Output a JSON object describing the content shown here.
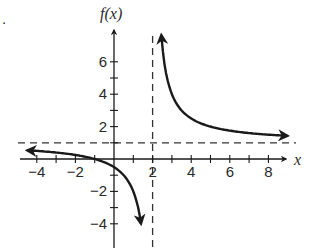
{
  "problem_marker": ".",
  "chart_data": {
    "type": "line",
    "title": "",
    "xlabel": "x",
    "ylabel": "f(x)",
    "function": "f(x) = (x + 1)/(x - 2)",
    "xlim": [
      -4.5,
      9
    ],
    "ylim": [
      -5,
      7.5
    ],
    "x_ticks": [
      -4,
      -3,
      -2,
      -1,
      0,
      1,
      2,
      3,
      4,
      5,
      6,
      7,
      8
    ],
    "x_tick_labels": [
      "-4",
      "-2",
      "2",
      "4",
      "6",
      "8"
    ],
    "x_tick_label_values": [
      -4,
      -2,
      2,
      4,
      6,
      8
    ],
    "y_ticks": [
      -4,
      -3,
      -2,
      -1,
      0,
      1,
      2,
      3,
      4,
      5,
      6
    ],
    "y_tick_labels": [
      "6",
      "4",
      "2",
      "-2",
      "-4"
    ],
    "y_tick_label_values": [
      6,
      4,
      2,
      -2,
      -4
    ],
    "asymptotes": {
      "vertical": {
        "x": 2,
        "style": "dashed"
      },
      "horizontal": {
        "y": 1,
        "style": "dashed"
      }
    },
    "grid": false,
    "series": [
      {
        "name": "left branch",
        "x": [
          -4.5,
          -4,
          -3,
          -2,
          -1,
          0,
          0.5,
          1,
          1.25,
          1.4
        ],
        "y": [
          0.54,
          0.5,
          0.4,
          0.25,
          0,
          -0.5,
          -1,
          -2,
          -3,
          -4
        ]
      },
      {
        "name": "right branch",
        "x": [
          2.45,
          2.5,
          2.75,
          3,
          3.5,
          4,
          5,
          6,
          7,
          8,
          9
        ],
        "y": [
          7.67,
          7,
          5,
          4,
          3,
          2.5,
          2,
          1.75,
          1.6,
          1.5,
          1.43
        ]
      }
    ],
    "key_points": {
      "x_intercept": -1,
      "y_intercept": -0.5
    }
  }
}
